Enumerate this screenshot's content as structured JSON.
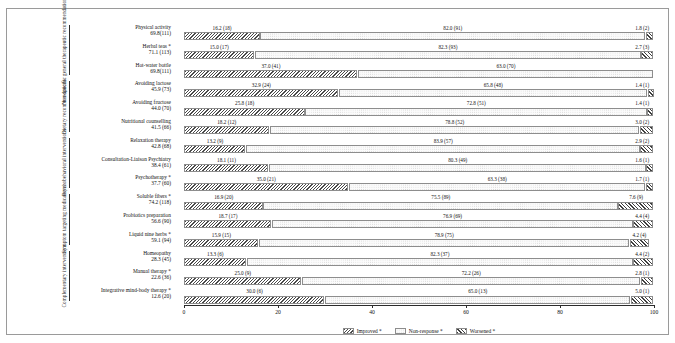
{
  "chart_data": {
    "type": "bar",
    "orientation": "horizontal",
    "stacked": true,
    "title": "",
    "xlabel": "",
    "ylabel": "",
    "xlim": [
      0,
      100
    ],
    "xticks": [
      0,
      20,
      40,
      60,
      80,
      100
    ],
    "xticklabels": [
      "0",
      "20",
      "40",
      "60",
      "80",
      "100"
    ],
    "grid": false,
    "legend_position": "bottom-center",
    "series": [
      {
        "name": "Improved *",
        "key": "improved",
        "pattern": "diagonal-hatch-backslash",
        "color": "#4a4a4a"
      },
      {
        "name": "Non-response *",
        "key": "nonresponse",
        "pattern": "dotted-light",
        "color": "#c2c2c2"
      },
      {
        "name": "Worsened *",
        "key": "worsened",
        "pattern": "diagonal-hatch-slash",
        "color": "#3f3f3f"
      }
    ],
    "groups": [
      {
        "label": "Non-specific general therapeutic recommendations",
        "rows": [
          0,
          1,
          2
        ]
      },
      {
        "label": "Dietary recommendations",
        "rows": [
          3,
          4,
          5
        ]
      },
      {
        "label": "Psychobehavioral interventions",
        "rows": [
          6,
          7,
          8
        ]
      },
      {
        "label": "Symptom targeting medications",
        "rows": [
          9,
          10,
          11
        ]
      },
      {
        "label": "Complementary interventions",
        "rows": [
          12,
          13,
          14
        ]
      }
    ],
    "categories": [
      {
        "name": "Physical activity",
        "usage": "69.8(111)",
        "improved": 16.2,
        "improved_label": "16.2 (18)",
        "nonresponse": 82.0,
        "nonresponse_label": "82.0 (91)",
        "worsened": 1.8,
        "worsened_label": "1.8 (2)"
      },
      {
        "name": "Herbal teas *",
        "usage": "71.1 (113)",
        "improved": 15.0,
        "improved_label": "15.0 (17)",
        "nonresponse": 82.3,
        "nonresponse_label": "82.3 (93)",
        "worsened": 2.7,
        "worsened_label": "2.7 (3)"
      },
      {
        "name": "Hot-water bottle",
        "usage": "69.8(111)",
        "improved": 37.0,
        "improved_label": "37.0 (41)",
        "nonresponse": 63.0,
        "nonresponse_label": "63.0 (70)",
        "worsened": 0.0,
        "worsened_label": ""
      },
      {
        "name": "Avoiding lactose",
        "usage": "45.9 (73)",
        "improved": 32.9,
        "improved_label": "32.9 (24)",
        "nonresponse": 65.8,
        "nonresponse_label": "65.8 (48)",
        "worsened": 1.4,
        "worsened_label": "1.4 (1)"
      },
      {
        "name": "Avoiding fructose",
        "usage": "44.0 (70)",
        "improved": 25.8,
        "improved_label": "25.8 (18)",
        "nonresponse": 72.8,
        "nonresponse_label": "72.8 (51)",
        "worsened": 1.4,
        "worsened_label": "1.4 (1)"
      },
      {
        "name": "Nutritional counselling",
        "usage": "41.5 (66)",
        "improved": 18.2,
        "improved_label": "18.2 (12)",
        "nonresponse": 78.8,
        "nonresponse_label": "78.8 (52)",
        "worsened": 3.0,
        "worsened_label": "3.0 (2)"
      },
      {
        "name": "Relaxation therapy",
        "usage": "42.8 (68)",
        "improved": 13.2,
        "improved_label": "13.2 (9)",
        "nonresponse": 83.9,
        "nonresponse_label": "83.9 (57)",
        "worsened": 2.9,
        "worsened_label": "2.9 (2)"
      },
      {
        "name": "Consultation-Liaison Psychiatry",
        "usage": "38.4 (61)",
        "improved": 18.1,
        "improved_label": "18.1 (11)",
        "nonresponse": 80.3,
        "nonresponse_label": "80.3 (49)",
        "worsened": 1.6,
        "worsened_label": "1.6 (1)"
      },
      {
        "name": "Psychotherapy *",
        "usage": "37.7 (60)",
        "improved": 35.0,
        "improved_label": "35.0 (21)",
        "nonresponse": 63.3,
        "nonresponse_label": "63.3 (38)",
        "worsened": 1.7,
        "worsened_label": "1.7 (1)"
      },
      {
        "name": "Soluble fibers *",
        "usage": "74.2 (118)",
        "improved": 16.9,
        "improved_label": "16.9 (20)",
        "nonresponse": 75.5,
        "nonresponse_label": "75.5 (89)",
        "worsened": 7.6,
        "worsened_label": "7.6 (9)"
      },
      {
        "name": "Probiotics preparation",
        "usage": "56.6 (90)",
        "improved": 18.7,
        "improved_label": "18.7 (17)",
        "nonresponse": 76.9,
        "nonresponse_label": "76.9 (69)",
        "worsened": 4.4,
        "worsened_label": "4.4 (4)"
      },
      {
        "name": "Liquid nine herbs *",
        "usage": "59.1 (94)",
        "improved": 15.9,
        "improved_label": "15.9 (15)",
        "nonresponse": 78.9,
        "nonresponse_label": "78.9 (75)",
        "worsened": 4.2,
        "worsened_label": "4.2 (4)"
      },
      {
        "name": "Homeopathy",
        "usage": "28.3 (45)",
        "improved": 13.3,
        "improved_label": "13.3 (6)",
        "nonresponse": 82.3,
        "nonresponse_label": "82.3 (37)",
        "worsened": 4.4,
        "worsened_label": "4.4 (2)"
      },
      {
        "name": "Manual therapy *",
        "usage": "22.6 (36)",
        "improved": 25.0,
        "improved_label": "25.0 (9)",
        "nonresponse": 72.2,
        "nonresponse_label": "72.2 (26)",
        "worsened": 2.8,
        "worsened_label": "2.8 (1)"
      },
      {
        "name": "Integrative mind-body therapy *",
        "usage": "12.6 (20)",
        "improved": 30.0,
        "improved_label": "30.0 (6)",
        "nonresponse": 65.0,
        "nonresponse_label": "65.0 (13)",
        "worsened": 5.0,
        "worsened_label": "5.0 (1)"
      }
    ]
  }
}
